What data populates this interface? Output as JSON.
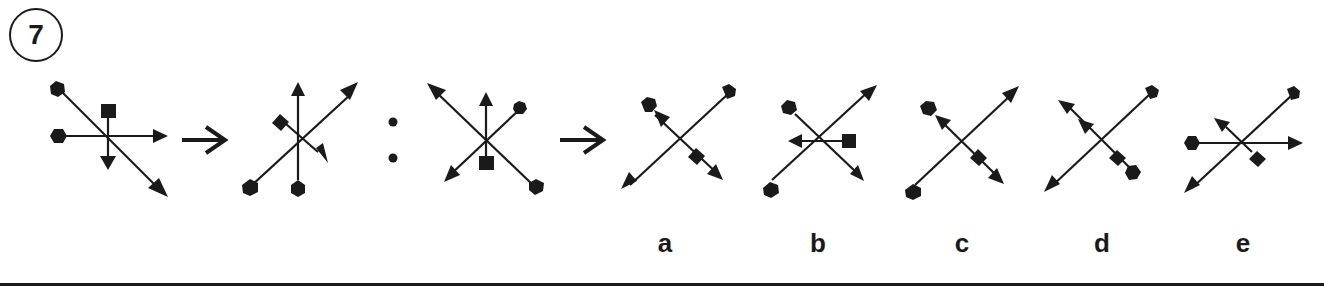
{
  "question": {
    "number": "7"
  },
  "puzzle": {
    "type": "figure-analogy",
    "relation_symbol": ":",
    "figures": [
      {
        "id": "A",
        "role": "premise",
        "description": "Diagonal arrow (pentagon tail top-left, head bottom-right); horizontal arrow (pentagon tail left, head right); short vertical arrow (square tail top, head down)"
      },
      {
        "id": "B",
        "role": "premise-result",
        "description": "Vertical arrow (hexagon tail bottom, head up); diagonal arrow (pentagon tail bottom-left, head top-right); short diagonal arrow (diamond tail, head bottom-right)"
      },
      {
        "id": "C",
        "role": "query",
        "description": "Diagonal arrow (pentagon tail bottom-right, head top-left); diagonal arrow (hexagon tail top-right, head bottom-left); short vertical arrow (square tail bottom, head up)"
      }
    ],
    "options": [
      {
        "label": "a",
        "description": "Diagonal arrow pentagon tail top-right head bottom-left; diagonal double arrow with hexagon top-left, arrowhead near, diamond, arrowhead bottom-right"
      },
      {
        "label": "b",
        "description": "Diagonal arrow pentagon tail bottom-left head top-right; diagonal arrow hexagon tail top-left head bottom-right; short horizontal arrow square tail right head left"
      },
      {
        "label": "c",
        "description": "Diagonal arrow pentagon tail bottom-left head top-right; hexagon top-left with arrow toward it, diamond, arrowhead bottom-right"
      },
      {
        "label": "d",
        "description": "Diagonal arrow pentagon tail top-right head bottom-left; double arrowhead top-left, diamond and hexagon bottom-right"
      },
      {
        "label": "e",
        "description": "Diagonal arrow pentagon tail top-right head bottom-left; horizontal arrow hexagon tail left head right; short diagonal arrow diamond tail head top-left"
      }
    ]
  },
  "colors": {
    "ink": "#1a1a1a",
    "background": "#ffffff"
  }
}
